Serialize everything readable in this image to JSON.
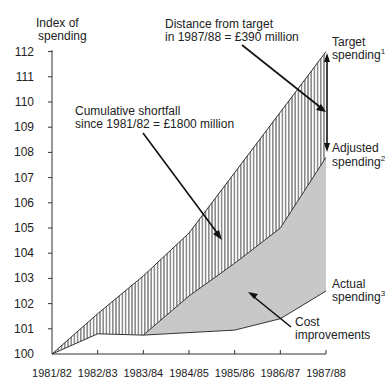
{
  "chart_data": {
    "type": "area",
    "title": "",
    "ylabel": "Index of spending",
    "ylabel_lines": [
      "Index of",
      "spending"
    ],
    "xlabel": "",
    "categories": [
      "1981/82",
      "1982/83",
      "1983/84",
      "1984/85",
      "1985/86",
      "1986/87",
      "1987/88"
    ],
    "ylim": [
      100,
      112
    ],
    "yticks": [
      100,
      101,
      102,
      103,
      104,
      105,
      106,
      107,
      108,
      109,
      110,
      111,
      112
    ],
    "grid": false,
    "series": [
      {
        "name": "Target spending",
        "superscript": "1",
        "values": [
          100,
          101.6,
          103.1,
          104.8,
          107.2,
          109.6,
          112.0
        ]
      },
      {
        "name": "Adjusted spending",
        "superscript": "2",
        "values": [
          100,
          100.8,
          100.75,
          102.3,
          103.6,
          105.0,
          107.8
        ]
      },
      {
        "name": "Actual spending",
        "superscript": "3",
        "values": [
          null,
          null,
          100.75,
          100.85,
          100.95,
          101.4,
          102.5
        ]
      }
    ],
    "regions": [
      {
        "name": "Cumulative shortfall",
        "between": [
          "Target spending",
          "Adjusted spending"
        ],
        "fill": "vertical-hatch"
      },
      {
        "name": "Cost improvements",
        "between": [
          "Adjusted spending",
          "Actual spending"
        ],
        "fill": "#c8c8c8"
      }
    ],
    "annotations": [
      {
        "id": "distance",
        "lines": [
          "Distance from target",
          "in 1987/88 = £390 million"
        ]
      },
      {
        "id": "shortfall",
        "lines": [
          "Cumulative shortfall",
          "since 1981/82 = £1800 million"
        ]
      },
      {
        "id": "cost",
        "lines": [
          "Cost",
          "improvements"
        ]
      },
      {
        "id": "target",
        "lines": [
          "Target",
          "spending"
        ],
        "sup": "1"
      },
      {
        "id": "adjusted",
        "lines": [
          "Adjusted",
          "spending"
        ],
        "sup": "2"
      },
      {
        "id": "actual",
        "lines": [
          "Actual",
          "spending"
        ],
        "sup": "3"
      }
    ],
    "colors": {
      "line": "#333333",
      "shade": "#c8c8c8",
      "hatch": "#333333"
    }
  }
}
